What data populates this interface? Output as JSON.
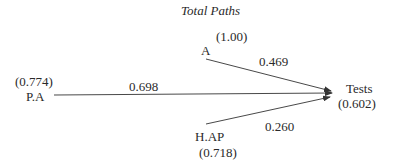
{
  "diagram": {
    "title": "Total Paths",
    "nodes": {
      "a": {
        "label": "A",
        "value": "(1.00)"
      },
      "pa": {
        "label": "P.A",
        "value": "(0.774)"
      },
      "hap": {
        "label": "H.AP",
        "value": "(0.718)"
      },
      "tests": {
        "label": "Tests",
        "value": "(0.602)"
      }
    },
    "edges": {
      "a_tests": {
        "from": "A",
        "to": "Tests",
        "weight": "0.469"
      },
      "pa_tests": {
        "from": "P.A",
        "to": "Tests",
        "weight": "0.698"
      },
      "hap_tests": {
        "from": "H.AP",
        "to": "Tests",
        "weight": "0.260"
      }
    },
    "colors": {
      "line": "#333333",
      "text": "#2a2a2a",
      "background": "#ffffff"
    }
  }
}
